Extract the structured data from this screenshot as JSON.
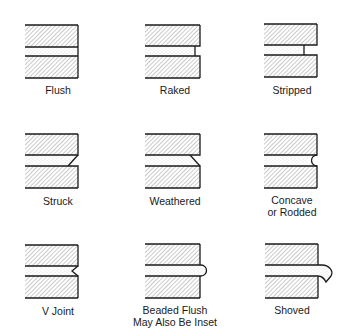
{
  "colors": {
    "line": "#1a1a1a",
    "hatch": "#8a8a8a",
    "mortar_dots": "#b5b5b5",
    "background": "#ffffff"
  },
  "joints": [
    {
      "id": "flush",
      "label": "Flush",
      "label2": ""
    },
    {
      "id": "raked",
      "label": "Raked",
      "label2": ""
    },
    {
      "id": "stripped",
      "label": "Stripped",
      "label2": ""
    },
    {
      "id": "struck",
      "label": "Struck",
      "label2": ""
    },
    {
      "id": "weathered",
      "label": "Weathered",
      "label2": ""
    },
    {
      "id": "concave",
      "label": "Concave",
      "label2": "or Rodded"
    },
    {
      "id": "v-joint",
      "label": "V Joint",
      "label2": ""
    },
    {
      "id": "beaded",
      "label": "Beaded Flush",
      "label2": "May Also Be Inset"
    },
    {
      "id": "shoved",
      "label": "Shoved",
      "label2": ""
    }
  ]
}
